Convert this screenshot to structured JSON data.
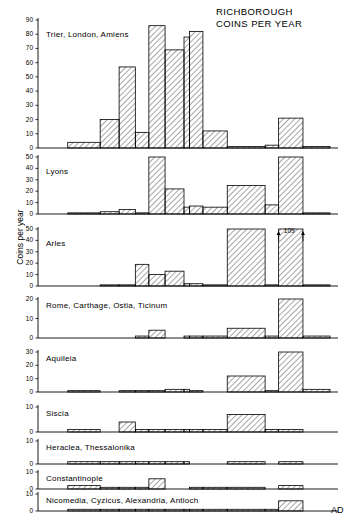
{
  "title": {
    "line1": "RICHBOROUGH",
    "line2": "COINS PER YEAR"
  },
  "axes": {
    "ylabel": "Coins per year",
    "xlabel": "AD",
    "xticks": [
      "294",
      "305",
      "317",
      "324",
      "330",
      "335",
      "341",
      "348",
      "350",
      "355",
      "364",
      "378",
      "383",
      "392",
      "402"
    ]
  },
  "chart_data": {
    "type": "bar",
    "title": "RICHBOROUGH COINS PER YEAR",
    "xlabel": "AD",
    "ylabel": "Coins per year",
    "grid": false,
    "legend": false,
    "note": "Nine stacked histogram panels, one per mint group. Bars are step-histograms spanning unequal date intervals; the x axis is linear in years from 294 to 402 AD.",
    "x_edges": [
      294,
      305,
      317,
      324,
      330,
      335,
      341,
      348,
      350,
      355,
      364,
      378,
      383,
      392,
      402
    ],
    "interval_labels": [
      "294-305",
      "305-317",
      "317-324",
      "324-330",
      "330-335",
      "335-341",
      "341-348",
      "348-350",
      "350-355",
      "355-364",
      "364-378",
      "378-383",
      "383-392",
      "392-402"
    ],
    "panels": [
      {
        "name": "Trier, London, Amiens",
        "ylim": [
          0,
          90
        ],
        "yticks": [
          0,
          10,
          20,
          30,
          40,
          50,
          60,
          70,
          80,
          90
        ],
        "values": [
          0,
          4,
          20,
          57,
          11,
          86,
          69,
          78,
          82,
          12,
          1,
          2,
          21,
          1
        ]
      },
      {
        "name": "Lyons",
        "ylim": [
          0,
          50
        ],
        "yticks": [
          0,
          10,
          20,
          30,
          40,
          50
        ],
        "values": [
          0,
          1,
          2,
          4,
          1,
          50,
          22,
          6,
          7,
          7,
          6,
          25,
          8,
          50,
          1
        ],
        "values_note": "fifteen step segments; last value is the short tail after 392",
        "values_fixed": [
          0,
          1,
          2,
          4,
          1,
          50,
          22,
          6,
          7,
          6,
          25,
          8,
          50,
          1
        ]
      },
      {
        "name": "Arles",
        "ylim": [
          0,
          50
        ],
        "yticks": [
          0,
          10,
          20,
          30,
          40,
          50
        ],
        "values": [
          0,
          0,
          1,
          1,
          19,
          10,
          13,
          2,
          2,
          1,
          50,
          1,
          109,
          1
        ],
        "annotations": [
          {
            "text": "109",
            "x_interval": "383-392",
            "value": 109,
            "clipped": true
          }
        ]
      },
      {
        "name": "Rome, Carthage, Ostia, Ticinum",
        "ylim": [
          0,
          20
        ],
        "yticks": [
          0,
          10,
          20
        ],
        "values": [
          0,
          0,
          0,
          0,
          1,
          4,
          0,
          1,
          1,
          1,
          5,
          1,
          23,
          1
        ]
      },
      {
        "name": "Aquileia",
        "ylim": [
          0,
          30
        ],
        "yticks": [
          0,
          10,
          20,
          30
        ],
        "values": [
          0,
          1,
          0,
          1,
          1,
          1,
          2,
          2,
          1,
          0,
          12,
          1,
          33,
          2
        ]
      },
      {
        "name": "Siscia",
        "ylim": [
          0,
          10
        ],
        "yticks": [
          0,
          10
        ],
        "values": [
          0,
          1,
          0,
          4,
          1,
          1,
          1,
          1,
          1,
          1,
          7,
          1,
          1,
          0
        ]
      },
      {
        "name": "Heraclea, Thessalonika",
        "ylim": [
          0,
          10
        ],
        "yticks": [
          0,
          10
        ],
        "values": [
          0,
          1,
          1,
          1,
          1,
          1,
          1,
          1,
          0,
          0,
          1,
          0,
          1,
          0
        ]
      },
      {
        "name": "Constantinople",
        "ylim": [
          0,
          10
        ],
        "yticks": [
          0,
          10
        ],
        "values": [
          0,
          2,
          1,
          1,
          1,
          6,
          0,
          0,
          1,
          1,
          1,
          0,
          2,
          0
        ]
      },
      {
        "name": "Nicomedia, Cyzicus, Alexandria, Antioch",
        "ylim": [
          0,
          10
        ],
        "yticks": [
          0,
          10
        ],
        "values": [
          0,
          1,
          1,
          1,
          1,
          1,
          1,
          1,
          1,
          1,
          1,
          1,
          6,
          0
        ]
      }
    ]
  }
}
